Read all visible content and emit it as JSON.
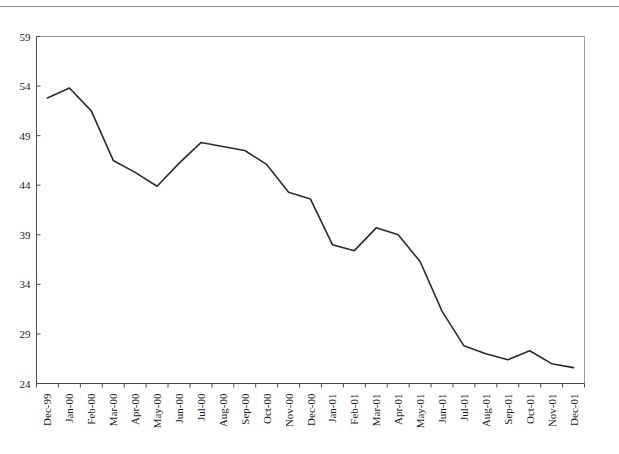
{
  "page": {
    "background_color": "#ffffff",
    "top_rule_color": "#8d8d8d"
  },
  "chart_data": {
    "type": "line",
    "title": "",
    "subtitle": "",
    "xlabel": "",
    "ylabel": "",
    "categories": [
      "Dec-99",
      "Jan-00",
      "Feb-00",
      "Mar-00",
      "Apr-00",
      "May-00",
      "Jun-00",
      "Jul-00",
      "Aug-00",
      "Sep-00",
      "Oct-00",
      "Nov-00",
      "Dec-00",
      "Jan-01",
      "Feb-01",
      "Mar-01",
      "Apr-01",
      "May-01",
      "Jun-01",
      "Jul-01",
      "Aug-01",
      "Sep-01",
      "Oct-01",
      "Nov-01",
      "Dec-01"
    ],
    "values": [
      52.8,
      53.8,
      51.5,
      46.5,
      45.3,
      43.9,
      46.2,
      48.3,
      47.9,
      47.5,
      46.1,
      43.3,
      42.6,
      38.0,
      37.4,
      39.7,
      39.0,
      36.3,
      31.3,
      27.8,
      27.0,
      26.4,
      27.3,
      26.0,
      25.6
    ],
    "ylim": [
      24,
      59
    ],
    "yticks": [
      24,
      29,
      34,
      39,
      44,
      49,
      54,
      59
    ],
    "ytick_labels": [
      "24",
      "29",
      "34",
      "39",
      "44",
      "49",
      "54",
      "59"
    ],
    "grid": false,
    "legend": null,
    "legend_position": "none",
    "series_color": "#2b2b2b",
    "axis_color": "#4a4a4a",
    "frame_color": "#9a9a9a"
  }
}
